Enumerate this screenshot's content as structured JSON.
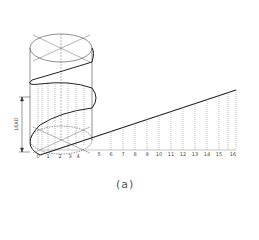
{
  "figure": {
    "caption": "(a)",
    "dimension_label": "LEAD",
    "baseline_labels": [
      "0",
      "1",
      "2",
      "3",
      "4",
      "5",
      "6",
      "7",
      "8",
      "9",
      "10",
      "11",
      "12",
      "13",
      "14",
      "15",
      "16"
    ],
    "colors": {
      "line": "#333333",
      "dashed": "#777777"
    }
  }
}
